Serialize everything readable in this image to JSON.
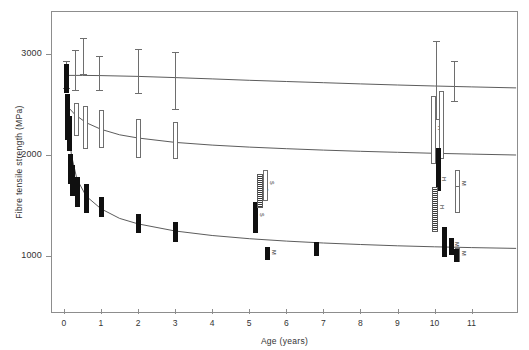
{
  "figure": {
    "background": "#ffffff",
    "axis_color": "#8d8d8d"
  },
  "chart_data": {
    "type": "scatter",
    "title": "",
    "xlabel": "Age (years)",
    "ylabel": "Fibre tensile strength (MPa)",
    "xlim": [
      -0.35,
      12.25
    ],
    "ylim": [
      430,
      3430
    ],
    "xticks": [
      0,
      1,
      2,
      3,
      4,
      5,
      6,
      7,
      8,
      9,
      10,
      11
    ],
    "xticklabels": [
      "0",
      "1",
      "2",
      "3",
      "4",
      "5",
      "6",
      "7",
      "8",
      "9",
      "10",
      "11"
    ],
    "yticks": [
      1000,
      2000,
      3000
    ],
    "yticklabels": [
      "1000",
      "2000",
      "3000"
    ],
    "grid": false,
    "legend": false,
    "series": [
      {
        "name": "high-strength fibre",
        "marker": "capped-error-bar",
        "color": "#6e6e6e",
        "points": [
          {
            "x": 0.08,
            "y": 2800,
            "low": 2660,
            "high": 2935,
            "label": ""
          },
          {
            "x": 0.3,
            "y": 2840,
            "low": 2640,
            "high": 3045,
            "label": ""
          },
          {
            "x": 0.52,
            "y": 2980,
            "low": 2795,
            "high": 3165,
            "label": ""
          },
          {
            "x": 0.95,
            "y": 2810,
            "low": 2640,
            "high": 2980,
            "label": ""
          },
          {
            "x": 2.0,
            "y": 2830,
            "low": 2605,
            "high": 3055,
            "label": ""
          },
          {
            "x": 3.0,
            "y": 2735,
            "low": 2450,
            "high": 3020,
            "label": ""
          },
          {
            "x": 10.05,
            "y": 2745,
            "low": 2350,
            "high": 3130,
            "label": ""
          },
          {
            "x": 10.55,
            "y": 2730,
            "low": 2525,
            "high": 2935,
            "label": ""
          }
        ]
      },
      {
        "name": "intermediate fibre",
        "marker": "open-rectangle",
        "color": "#6e6e6e",
        "points": [
          {
            "x": 0.1,
            "y": 2490,
            "low": 2415,
            "high": 2565,
            "label": ""
          },
          {
            "x": 0.33,
            "y": 2350,
            "low": 2185,
            "high": 2515,
            "label": ""
          },
          {
            "x": 0.58,
            "y": 2275,
            "low": 2060,
            "high": 2490,
            "label": ""
          },
          {
            "x": 1.02,
            "y": 2255,
            "low": 2065,
            "high": 2445,
            "label": ""
          },
          {
            "x": 2.02,
            "y": 2160,
            "low": 1965,
            "high": 2355,
            "label": ""
          },
          {
            "x": 3.02,
            "y": 2145,
            "low": 1960,
            "high": 2330,
            "label": ""
          },
          {
            "x": 5.3,
            "y": 1630,
            "low": 1500,
            "high": 1760,
            "label": "S"
          },
          {
            "x": 5.45,
            "y": 1700,
            "low": 1545,
            "high": 1855,
            "label": "S"
          },
          {
            "x": 9.98,
            "y": 2250,
            "low": 1910,
            "high": 2590,
            "label": "H"
          },
          {
            "x": 10.18,
            "y": 2300,
            "low": 1960,
            "high": 2640,
            "label": ""
          },
          {
            "x": 10.62,
            "y": 1705,
            "low": 1560,
            "high": 1850,
            "label": "M"
          },
          {
            "x": 10.62,
            "y": 1555,
            "low": 1420,
            "high": 1690,
            "label": ""
          },
          {
            "x": 10.62,
            "y": 1010,
            "low": 940,
            "high": 1080,
            "label": "M"
          }
        ]
      },
      {
        "name": "low-strength fibre",
        "marker": "solid-rectangle",
        "color": "#101010",
        "points": [
          {
            "x": 0.06,
            "y": 2760,
            "low": 2620,
            "high": 2900,
            "label": ""
          },
          {
            "x": 0.1,
            "y": 2380,
            "low": 2150,
            "high": 2610,
            "label": ""
          },
          {
            "x": 0.14,
            "y": 2215,
            "low": 2040,
            "high": 2390,
            "label": ""
          },
          {
            "x": 0.17,
            "y": 1860,
            "low": 1715,
            "high": 2005,
            "label": ""
          },
          {
            "x": 0.22,
            "y": 1745,
            "low": 1590,
            "high": 1900,
            "label": ""
          },
          {
            "x": 0.36,
            "y": 1630,
            "low": 1480,
            "high": 1780,
            "label": ""
          },
          {
            "x": 0.62,
            "y": 1565,
            "low": 1420,
            "high": 1710,
            "label": ""
          },
          {
            "x": 1.02,
            "y": 1485,
            "low": 1385,
            "high": 1585,
            "label": ""
          },
          {
            "x": 2.02,
            "y": 1320,
            "low": 1225,
            "high": 1415,
            "label": ""
          },
          {
            "x": 3.02,
            "y": 1235,
            "low": 1135,
            "high": 1335,
            "label": ""
          },
          {
            "x": 5.18,
            "y": 1380,
            "low": 1225,
            "high": 1535,
            "label": "S"
          },
          {
            "x": 5.5,
            "y": 1020,
            "low": 955,
            "high": 1085,
            "label": "M"
          },
          {
            "x": 6.8,
            "y": 1070,
            "low": 1000,
            "high": 1140,
            "label": ""
          },
          {
            "x": 10.1,
            "y": 1930,
            "low": 1790,
            "high": 2070,
            "label": ""
          },
          {
            "x": 10.1,
            "y": 1745,
            "low": 1640,
            "high": 1850,
            "label": "H"
          },
          {
            "x": 10.28,
            "y": 1135,
            "low": 985,
            "high": 1285,
            "label": ""
          },
          {
            "x": 10.45,
            "y": 1095,
            "low": 1010,
            "high": 1180,
            "label": "M"
          },
          {
            "x": 10.58,
            "y": 1005,
            "low": 940,
            "high": 1070,
            "label": ""
          }
        ]
      },
      {
        "name": "stippled samples",
        "marker": "stippled-rectangle",
        "color": "#3a3a3a",
        "points": [
          {
            "x": 5.28,
            "y": 1640,
            "low": 1470,
            "high": 1810,
            "label": ""
          },
          {
            "x": 10.02,
            "y": 1460,
            "low": 1235,
            "high": 1685,
            "label": "H"
          }
        ]
      }
    ],
    "trend_curves": [
      {
        "name": "upper fitted curve",
        "color": "#4a4a4a",
        "points_xy": [
          [
            0.0,
            2790
          ],
          [
            0.5,
            2790
          ],
          [
            1.0,
            2788
          ],
          [
            2.0,
            2780
          ],
          [
            3.0,
            2768
          ],
          [
            4.0,
            2755
          ],
          [
            5.0,
            2742
          ],
          [
            6.0,
            2730
          ],
          [
            7.0,
            2718
          ],
          [
            8.0,
            2706
          ],
          [
            9.0,
            2695
          ],
          [
            10.0,
            2685
          ],
          [
            11.0,
            2676
          ],
          [
            12.2,
            2666
          ]
        ]
      },
      {
        "name": "middle fitted curve",
        "color": "#4a4a4a",
        "points_xy": [
          [
            0.05,
            2500
          ],
          [
            0.3,
            2400
          ],
          [
            0.6,
            2320
          ],
          [
            1.0,
            2255
          ],
          [
            1.5,
            2200
          ],
          [
            2.0,
            2168
          ],
          [
            3.0,
            2125
          ],
          [
            4.0,
            2098
          ],
          [
            5.0,
            2078
          ],
          [
            6.0,
            2062
          ],
          [
            7.0,
            2048
          ],
          [
            8.0,
            2036
          ],
          [
            9.0,
            2026
          ],
          [
            10.0,
            2016
          ],
          [
            11.0,
            2008
          ],
          [
            12.2,
            2000
          ]
        ]
      },
      {
        "name": "lower fitted curve",
        "color": "#4a4a4a",
        "points_xy": [
          [
            0.1,
            2400
          ],
          [
            0.2,
            2000
          ],
          [
            0.35,
            1760
          ],
          [
            0.6,
            1590
          ],
          [
            1.0,
            1465
          ],
          [
            1.5,
            1370
          ],
          [
            2.0,
            1315
          ],
          [
            3.0,
            1245
          ],
          [
            4.0,
            1200
          ],
          [
            5.0,
            1168
          ],
          [
            6.0,
            1144
          ],
          [
            7.0,
            1125
          ],
          [
            8.0,
            1110
          ],
          [
            9.0,
            1098
          ],
          [
            10.0,
            1088
          ],
          [
            11.0,
            1080
          ],
          [
            12.2,
            1072
          ]
        ]
      }
    ]
  }
}
